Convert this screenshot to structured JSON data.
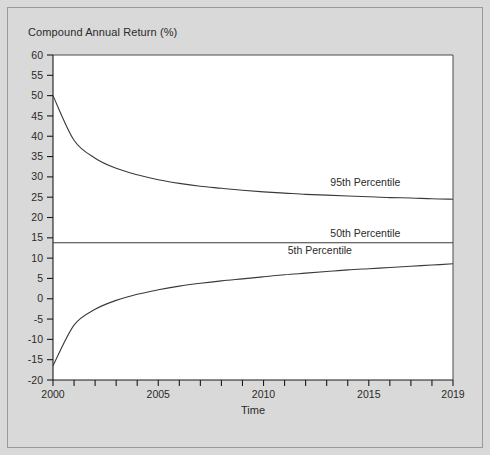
{
  "chart_data": {
    "type": "line",
    "title": "Compound Annual Return (%)",
    "xlabel": "Time",
    "ylabel": "",
    "xlim": [
      2000,
      2019
    ],
    "ylim": [
      -20,
      60
    ],
    "grid": false,
    "legend_position": "inline-right",
    "x_ticks_major": [
      "2000",
      "2005",
      "2010",
      "2015",
      "2019"
    ],
    "x_ticks_major_values": [
      2000,
      2005,
      2010,
      2015,
      2019
    ],
    "x_ticks_minor_values": [
      2000,
      2001,
      2002,
      2003,
      2004,
      2005,
      2006,
      2007,
      2008,
      2009,
      2010,
      2011,
      2012,
      2013,
      2014,
      2015,
      2016,
      2017,
      2018,
      2019
    ],
    "y_ticks": [
      "60",
      "55",
      "50",
      "45",
      "40",
      "35",
      "30",
      "25",
      "20",
      "15",
      "10",
      "5",
      "0",
      "-5",
      "-10",
      "-15",
      "-20"
    ],
    "y_tick_values": [
      60,
      55,
      50,
      45,
      40,
      35,
      30,
      25,
      20,
      15,
      10,
      5,
      0,
      -5,
      -10,
      -15,
      -20
    ],
    "x": [
      2000,
      2001,
      2002,
      2003,
      2004,
      2005,
      2006,
      2007,
      2008,
      2009,
      2010,
      2011,
      2012,
      2013,
      2014,
      2015,
      2016,
      2017,
      2018,
      2019
    ],
    "series": [
      {
        "name": "95th Percentile",
        "label": "95th Percentile",
        "color": "#3a3a3a",
        "values": [
          50.0,
          39.0,
          34.6,
          32.1,
          30.5,
          29.3,
          28.4,
          27.7,
          27.2,
          26.7,
          26.3,
          26.0,
          25.7,
          25.5,
          25.3,
          25.1,
          24.9,
          24.8,
          24.6,
          24.5
        ]
      },
      {
        "name": "50th Percentile",
        "label": "50th Percentile",
        "color": "#3a3a3a",
        "values": [
          13.8,
          13.8,
          13.8,
          13.8,
          13.8,
          13.8,
          13.8,
          13.8,
          13.8,
          13.8,
          13.8,
          13.8,
          13.8,
          13.8,
          13.8,
          13.8,
          13.8,
          13.8,
          13.8,
          13.8
        ]
      },
      {
        "name": "5th Percentile",
        "label": "5th Percentile",
        "color": "#3a3a3a",
        "values": [
          -16.5,
          -6.5,
          -2.6,
          -0.4,
          1.1,
          2.2,
          3.1,
          3.8,
          4.4,
          4.9,
          5.4,
          5.9,
          6.3,
          6.7,
          7.1,
          7.4,
          7.7,
          8.0,
          8.3,
          8.6
        ]
      }
    ],
    "label_anchors": [
      {
        "series": "95th Percentile",
        "x": 2016.5,
        "y": 27.8
      },
      {
        "series": "50th Percentile",
        "x": 2016.5,
        "y": 15.3
      },
      {
        "series": "5th Percentile",
        "x": 2014.2,
        "y": 11.0
      }
    ]
  },
  "colors": {
    "figure_background": "#d9d9d9",
    "plot_background": "#ffffff",
    "axis": "#1a1a1a",
    "series": "#3a3a3a",
    "frame_border": "#9a9a9a"
  }
}
